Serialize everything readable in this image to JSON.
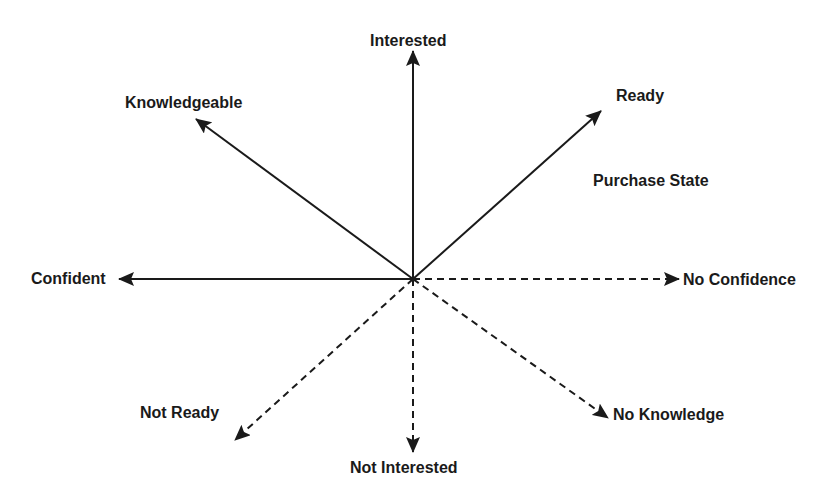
{
  "diagram": {
    "title": "Purchase State",
    "center": {
      "x": 413,
      "y": 279
    },
    "colors": {
      "line": "#1a1a1a",
      "text": "#1a1a1a",
      "background": "#ffffff"
    },
    "axes": [
      {
        "id": "interested",
        "label": "Interested",
        "style": "solid",
        "tip": {
          "x": 413,
          "y": 51
        }
      },
      {
        "id": "knowledgeable",
        "label": "Knowledgeable",
        "style": "solid",
        "tip": {
          "x": 196,
          "y": 119
        }
      },
      {
        "id": "ready",
        "label": "Ready",
        "style": "solid",
        "tip": {
          "x": 601,
          "y": 111
        }
      },
      {
        "id": "confident",
        "label": "Confident",
        "style": "solid",
        "tip": {
          "x": 119,
          "y": 279
        }
      },
      {
        "id": "no-confidence",
        "label": "No Confidence",
        "style": "dashed",
        "tip": {
          "x": 679,
          "y": 279
        }
      },
      {
        "id": "not-ready",
        "label": "Not Ready",
        "style": "dashed",
        "tip": {
          "x": 235,
          "y": 440
        }
      },
      {
        "id": "not-interested",
        "label": "Not Interested",
        "style": "dashed",
        "tip": {
          "x": 413,
          "y": 452
        }
      },
      {
        "id": "no-knowledge",
        "label": "No Knowledge",
        "style": "dashed",
        "tip": {
          "x": 608,
          "y": 418
        }
      }
    ]
  }
}
